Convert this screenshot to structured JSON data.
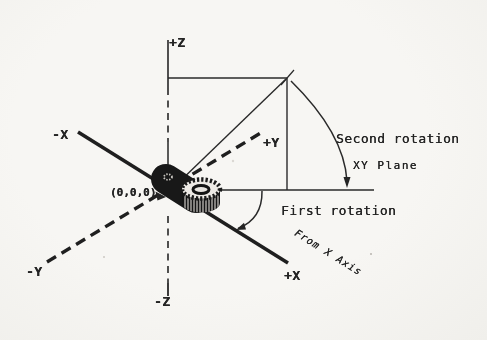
{
  "palette": {
    "paper": "#f6f5f1",
    "ink": "#242424"
  },
  "labels": {
    "z_pos": "+Z",
    "z_neg": "-Z",
    "x_pos": "+X",
    "x_neg": "-X",
    "y_pos": "+Y",
    "y_neg": "-Y",
    "origin": "(0,0,0)",
    "second_rotation": "Second rotation",
    "xy_plane": "XY Plane",
    "first_rotation": "First rotation",
    "from_x_axis": "From X Axis"
  }
}
